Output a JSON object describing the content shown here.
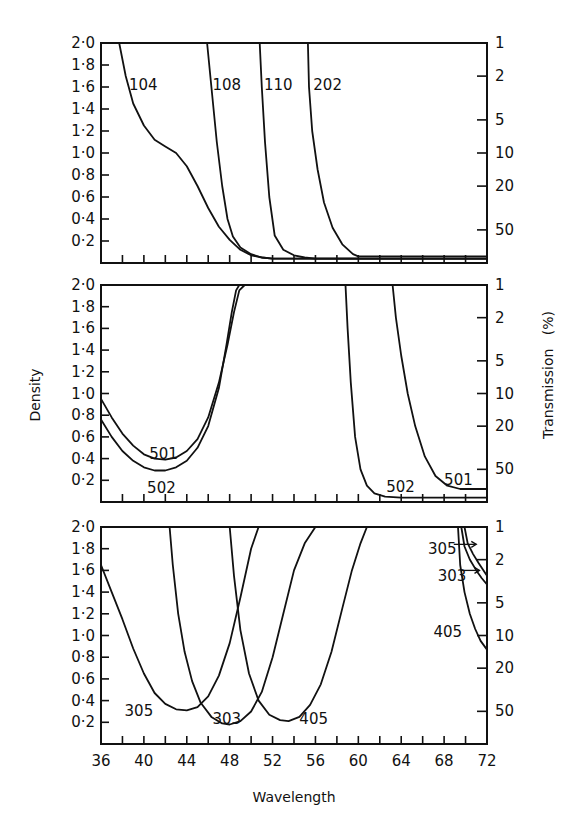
{
  "chart_data": {
    "type": "line",
    "title": "",
    "xlabel": "Wavelength",
    "ylabel": "Density",
    "ylabel_right": "Transmission   (%)",
    "x_ticks": [
      36,
      40,
      44,
      48,
      52,
      56,
      60,
      64,
      68,
      72
    ],
    "xlim": [
      36,
      72
    ],
    "ylim": [
      0,
      2.0
    ],
    "y_ticks": [
      "2·0",
      "1·8",
      "1·6",
      "1·4",
      "1·2",
      "1·0",
      "0·8",
      "0·6",
      "0·4",
      "0·2"
    ],
    "y_tick_values": [
      2.0,
      1.8,
      1.6,
      1.4,
      1.2,
      1.0,
      0.8,
      0.6,
      0.4,
      0.2
    ],
    "right_ticks": [
      {
        "label": "1",
        "density": 2.0
      },
      {
        "label": "2",
        "density": 1.699
      },
      {
        "label": "5",
        "density": 1.301
      },
      {
        "label": "10",
        "density": 1.0
      },
      {
        "label": "20",
        "density": 0.699
      },
      {
        "label": "50",
        "density": 0.301
      }
    ],
    "grid": false,
    "panels": [
      {
        "name": "top",
        "series": [
          {
            "name": "104",
            "x": [
              37.7,
              38.3,
              39.0,
              40.0,
              41.0,
              42.0,
              43.0,
              44.0,
              45.0,
              46.0,
              47.0,
              48.0,
              49.0,
              50.0,
              51.0,
              52.0,
              56.0,
              72.0
            ],
            "y": [
              2.0,
              1.7,
              1.45,
              1.25,
              1.12,
              1.06,
              1.0,
              0.88,
              0.7,
              0.5,
              0.33,
              0.21,
              0.12,
              0.07,
              0.05,
              0.04,
              0.04,
              0.04
            ]
          },
          {
            "name": "108",
            "x": [
              45.9,
              46.3,
              46.8,
              47.3,
              47.8,
              48.3,
              49.0,
              50.0,
              51.0,
              52.0,
              72.0
            ],
            "y": [
              2.0,
              1.6,
              1.1,
              0.7,
              0.4,
              0.24,
              0.14,
              0.08,
              0.05,
              0.04,
              0.04
            ]
          },
          {
            "name": "110",
            "x": [
              50.8,
              51.0,
              51.3,
              51.7,
              52.2,
              53.0,
              54.0,
              55.0,
              56.0,
              72.0
            ],
            "y": [
              2.0,
              1.6,
              1.1,
              0.6,
              0.25,
              0.12,
              0.07,
              0.05,
              0.04,
              0.04
            ]
          },
          {
            "name": "202",
            "x": [
              55.3,
              55.4,
              55.7,
              56.2,
              56.8,
              57.6,
              58.5,
              59.5,
              60.0,
              72.0
            ],
            "y": [
              2.0,
              1.6,
              1.2,
              0.85,
              0.55,
              0.32,
              0.17,
              0.08,
              0.06,
              0.06
            ]
          }
        ],
        "labels": [
          {
            "text": "104",
            "x": 38.6,
            "y": 1.62
          },
          {
            "text": "108",
            "x": 46.4,
            "y": 1.62
          },
          {
            "text": "110",
            "x": 51.2,
            "y": 1.62
          },
          {
            "text": "202",
            "x": 55.8,
            "y": 1.62
          }
        ]
      },
      {
        "name": "middle",
        "series": [
          {
            "name": "501",
            "x": [
              36.0,
              37.0,
              38.0,
              39.0,
              40.0,
              41.0,
              42.0,
              43.0,
              44.0,
              45.0,
              46.0,
              47.0,
              47.8,
              48.4,
              48.9,
              49.4
            ],
            "y": [
              0.95,
              0.78,
              0.63,
              0.52,
              0.44,
              0.4,
              0.39,
              0.41,
              0.47,
              0.58,
              0.78,
              1.1,
              1.45,
              1.75,
              1.95,
              2.0
            ]
          },
          {
            "name": "502",
            "x": [
              36.0,
              37.0,
              38.0,
              39.0,
              40.0,
              41.0,
              42.0,
              43.0,
              44.0,
              45.0,
              46.0,
              47.0,
              47.7,
              48.2,
              48.6,
              48.9
            ],
            "y": [
              0.76,
              0.6,
              0.47,
              0.38,
              0.32,
              0.29,
              0.29,
              0.32,
              0.38,
              0.5,
              0.7,
              1.05,
              1.45,
              1.75,
              1.95,
              2.0
            ]
          },
          {
            "name": "502_long",
            "x": [
              58.8,
              59.0,
              59.3,
              59.7,
              60.2,
              60.8,
              61.5,
              62.5,
              64.0,
              72.0
            ],
            "y": [
              2.0,
              1.6,
              1.1,
              0.6,
              0.3,
              0.15,
              0.08,
              0.05,
              0.04,
              0.04
            ]
          },
          {
            "name": "501_long",
            "x": [
              63.2,
              63.5,
              64.0,
              64.6,
              65.3,
              66.2,
              67.2,
              68.3,
              69.5,
              72.0
            ],
            "y": [
              2.0,
              1.7,
              1.35,
              1.0,
              0.7,
              0.42,
              0.24,
              0.15,
              0.12,
              0.12
            ]
          }
        ],
        "labels": [
          {
            "text": "501",
            "x": 40.5,
            "y": 0.44
          },
          {
            "text": "502",
            "x": 40.3,
            "y": 0.13
          },
          {
            "text": "502",
            "x": 62.6,
            "y": 0.14
          },
          {
            "text": "501",
            "x": 68.0,
            "y": 0.2
          }
        ]
      },
      {
        "name": "bottom",
        "series": [
          {
            "name": "305",
            "x": [
              36.0,
              37.0,
              38.0,
              39.0,
              40.0,
              41.0,
              42.0,
              43.0,
              44.0,
              45.0,
              46.0,
              47.0,
              48.0,
              49.0,
              50.0,
              50.7
            ],
            "y": [
              1.65,
              1.4,
              1.15,
              0.88,
              0.65,
              0.47,
              0.37,
              0.32,
              0.31,
              0.34,
              0.44,
              0.63,
              0.93,
              1.35,
              1.8,
              2.0
            ]
          },
          {
            "name": "303",
            "x": [
              42.4,
              42.7,
              43.2,
              43.8,
              44.5,
              45.3,
              46.3,
              47.3,
              48.0,
              49.0,
              50.0,
              51.0,
              52.0,
              53.0,
              54.0,
              55.0,
              56.0
            ],
            "y": [
              2.0,
              1.65,
              1.2,
              0.85,
              0.58,
              0.38,
              0.25,
              0.19,
              0.18,
              0.21,
              0.3,
              0.48,
              0.8,
              1.2,
              1.6,
              1.85,
              2.0
            ]
          },
          {
            "name": "405",
            "x": [
              48.0,
              48.4,
              49.0,
              49.8,
              50.7,
              51.7,
              52.7,
              53.5,
              54.5,
              55.5,
              56.5,
              57.5,
              58.5,
              59.4,
              60.2,
              60.8
            ],
            "y": [
              2.0,
              1.55,
              1.05,
              0.65,
              0.4,
              0.27,
              0.22,
              0.21,
              0.25,
              0.36,
              0.55,
              0.85,
              1.25,
              1.6,
              1.85,
              2.0
            ]
          },
          {
            "name": "405_long",
            "x": [
              69.3,
              69.5,
              69.9,
              70.4,
              70.9,
              71.4,
              72.0
            ],
            "y": [
              2.0,
              1.65,
              1.4,
              1.2,
              1.06,
              0.95,
              0.87
            ]
          },
          {
            "name": "303_long",
            "x": [
              69.6,
              69.9,
              70.4,
              71.0,
              71.5,
              72.0
            ],
            "y": [
              2.0,
              1.82,
              1.7,
              1.6,
              1.53,
              1.47
            ]
          },
          {
            "name": "305_long",
            "x": [
              69.9,
              70.2,
              70.7,
              71.2,
              71.6,
              72.0
            ],
            "y": [
              2.0,
              1.85,
              1.75,
              1.67,
              1.61,
              1.55
            ]
          }
        ],
        "labels": [
          {
            "text": "305",
            "x": 38.2,
            "y": 0.3
          },
          {
            "text": "303",
            "x": 46.4,
            "y": 0.23
          },
          {
            "text": "405",
            "x": 54.5,
            "y": 0.23
          },
          {
            "text": "305",
            "x": 66.5,
            "y": 1.8
          },
          {
            "text": "303",
            "x": 67.4,
            "y": 1.55
          },
          {
            "text": "405",
            "x": 67.0,
            "y": 1.03
          }
        ],
        "arrows": [
          {
            "from_x": 68.9,
            "to_x": 71.0,
            "y": 1.84
          },
          {
            "from_x": 69.6,
            "to_x": 71.3,
            "y": 1.6
          }
        ]
      }
    ]
  }
}
